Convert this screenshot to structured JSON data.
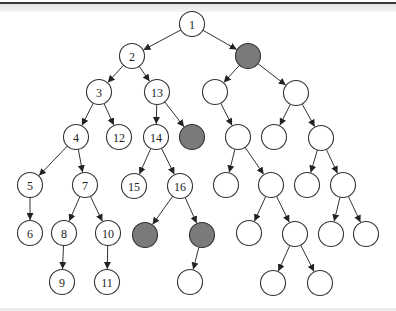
{
  "diagram": {
    "type": "tree",
    "colors": {
      "node_fill": "#ffffff",
      "highlight_fill": "#7a7a7a",
      "stroke": "#333333"
    },
    "nodes": [
      {
        "id": "n1",
        "label": "1",
        "highlighted": false
      },
      {
        "id": "n2",
        "label": "2",
        "highlighted": false
      },
      {
        "id": "g1",
        "label": "",
        "highlighted": true
      },
      {
        "id": "n3",
        "label": "3",
        "highlighted": false
      },
      {
        "id": "n13",
        "label": "13",
        "highlighted": false
      },
      {
        "id": "r1",
        "label": "",
        "highlighted": false
      },
      {
        "id": "r2",
        "label": "",
        "highlighted": false
      },
      {
        "id": "n4",
        "label": "4",
        "highlighted": false
      },
      {
        "id": "n12",
        "label": "12",
        "highlighted": false
      },
      {
        "id": "n14",
        "label": "14",
        "highlighted": false
      },
      {
        "id": "g2",
        "label": "",
        "highlighted": true
      },
      {
        "id": "r3",
        "label": "",
        "highlighted": false
      },
      {
        "id": "r4",
        "label": "",
        "highlighted": false
      },
      {
        "id": "r5",
        "label": "",
        "highlighted": false
      },
      {
        "id": "n5",
        "label": "5",
        "highlighted": false
      },
      {
        "id": "n7",
        "label": "7",
        "highlighted": false
      },
      {
        "id": "n15",
        "label": "15",
        "highlighted": false
      },
      {
        "id": "n16",
        "label": "16",
        "highlighted": false
      },
      {
        "id": "r6",
        "label": "",
        "highlighted": false
      },
      {
        "id": "r7",
        "label": "",
        "highlighted": false
      },
      {
        "id": "r8",
        "label": "",
        "highlighted": false
      },
      {
        "id": "r9",
        "label": "",
        "highlighted": false
      },
      {
        "id": "n6",
        "label": "6",
        "highlighted": false
      },
      {
        "id": "n8",
        "label": "8",
        "highlighted": false
      },
      {
        "id": "n10",
        "label": "10",
        "highlighted": false
      },
      {
        "id": "g3",
        "label": "",
        "highlighted": true
      },
      {
        "id": "g4",
        "label": "",
        "highlighted": true
      },
      {
        "id": "r10",
        "label": "",
        "highlighted": false
      },
      {
        "id": "r11",
        "label": "",
        "highlighted": false
      },
      {
        "id": "r12",
        "label": "",
        "highlighted": false
      },
      {
        "id": "r13",
        "label": "",
        "highlighted": false
      },
      {
        "id": "n9",
        "label": "9",
        "highlighted": false
      },
      {
        "id": "n11",
        "label": "11",
        "highlighted": false
      },
      {
        "id": "r14",
        "label": "",
        "highlighted": false
      },
      {
        "id": "r15",
        "label": "",
        "highlighted": false
      },
      {
        "id": "r16",
        "label": "",
        "highlighted": false
      }
    ],
    "edges": [
      [
        "n1",
        "n2"
      ],
      [
        "n1",
        "g1"
      ],
      [
        "n2",
        "n3"
      ],
      [
        "n2",
        "n13"
      ],
      [
        "g1",
        "r1"
      ],
      [
        "g1",
        "r2"
      ],
      [
        "n3",
        "n4"
      ],
      [
        "n3",
        "n12"
      ],
      [
        "n13",
        "n14"
      ],
      [
        "n13",
        "g2"
      ],
      [
        "r1",
        "r3"
      ],
      [
        "r2",
        "r4"
      ],
      [
        "r2",
        "r5"
      ],
      [
        "n4",
        "n5"
      ],
      [
        "n4",
        "n7"
      ],
      [
        "n14",
        "n15"
      ],
      [
        "n14",
        "n16"
      ],
      [
        "r3",
        "r6"
      ],
      [
        "r3",
        "r7"
      ],
      [
        "r5",
        "r8"
      ],
      [
        "r5",
        "r9"
      ],
      [
        "n5",
        "n6"
      ],
      [
        "n7",
        "n8"
      ],
      [
        "n7",
        "n10"
      ],
      [
        "n16",
        "g3"
      ],
      [
        "n16",
        "g4"
      ],
      [
        "r7",
        "r10"
      ],
      [
        "r7",
        "r11"
      ],
      [
        "r9",
        "r12"
      ],
      [
        "r9",
        "r13"
      ],
      [
        "n8",
        "n9"
      ],
      [
        "n10",
        "n11"
      ],
      [
        "g4",
        "r14"
      ],
      [
        "r11",
        "r15"
      ],
      [
        "r11",
        "r16"
      ]
    ]
  }
}
